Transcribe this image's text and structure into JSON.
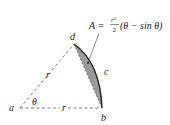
{
  "diagram": {
    "type": "circular-segment",
    "points": {
      "a": "a",
      "b": "b",
      "c": "c",
      "d": "d"
    },
    "radius_label_left": "r",
    "radius_label_bottom": "r",
    "angle_label": "θ",
    "formula": {
      "lhs": "A =",
      "numerator": "r²",
      "denominator": "2",
      "rhs": "(θ − sin θ)"
    },
    "colors": {
      "segment_fill": "#9a9a9a",
      "line": "#333333"
    }
  }
}
